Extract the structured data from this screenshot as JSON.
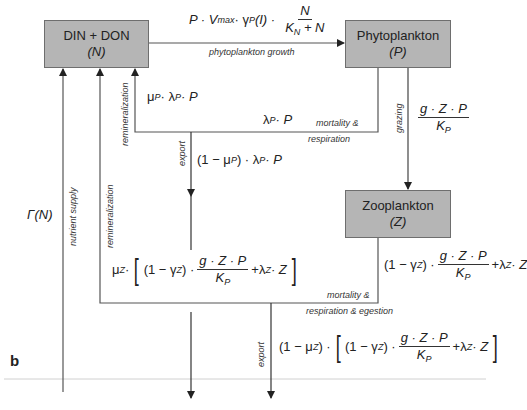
{
  "panel_label": "b",
  "boxes": {
    "nutrient": {
      "name": "DIN + DON",
      "symbol": "(N)"
    },
    "phyto": {
      "name": "Phytoplankton",
      "symbol": "(P)"
    },
    "zoo": {
      "name": "Zooplankton",
      "symbol": "(Z)"
    }
  },
  "flows": {
    "growth": {
      "label": "phytoplankton growth",
      "eq_prefix": "P · V",
      "eq_vmax_sub": "max",
      "eq_gamma": " · γ",
      "eq_gamma_sub": "P",
      "eq_arg": "(I) ·",
      "frac_num": "N",
      "frac_den_k": "K",
      "frac_den_sub": "N",
      "frac_den_rest": " + N"
    },
    "remin_p": {
      "label": "remineralization",
      "eq_mu": "μ",
      "eq_mu_sub": "P",
      "eq_mid": " · λ",
      "eq_lam_sub": "P",
      "eq_end": " · P"
    },
    "mort_p": {
      "label_line1": "mortality &",
      "label_line2": "respiration",
      "eq_lam": "λ",
      "eq_lam_sub": "P",
      "eq_end": " · P"
    },
    "export_p": {
      "label": "export",
      "eq_start": "(1 − μ",
      "eq_mu_sub": "P",
      "eq_mid": ") · λ",
      "eq_lam_sub": "P",
      "eq_end": " · P"
    },
    "grazing": {
      "label": "grazing",
      "frac_num": "g · Z · P",
      "frac_den_k": "K",
      "frac_den_sub": "P"
    },
    "nutrient_supply": {
      "label": "nutrient supply",
      "eq": "Γ(N)"
    },
    "remin_z": {
      "label": "remineralization",
      "eq_mu": "μ",
      "eq_mu_sub": "Z",
      "eq_dot": " ·",
      "eq_gamma_start": "(1 − γ",
      "eq_gamma_sub": "Z",
      "eq_gamma_end": ") ·",
      "frac_num": "g · Z · P",
      "frac_den_k": "K",
      "frac_den_sub": "P",
      "eq_lam": "+λ",
      "eq_lam_sub": "Z",
      "eq_end": " · Z"
    },
    "mort_z": {
      "label_line1": "mortality &",
      "label_line2": "respiration & egestion",
      "eq_gamma_start": "(1 − γ",
      "eq_gamma_sub": "Z",
      "eq_gamma_end": ") ·",
      "frac_num": "g · Z · P",
      "frac_den_k": "K",
      "frac_den_sub": "P",
      "eq_lam": "+λ",
      "eq_lam_sub": "Z",
      "eq_end": " · Z"
    },
    "export_z": {
      "label": "export",
      "eq_start": "(1 − μ",
      "eq_mu_sub": "Z",
      "eq_mid": ") ·",
      "eq_gamma_start": "(1 − γ",
      "eq_gamma_sub": "Z",
      "eq_gamma_end": ") ·",
      "frac_num": "g · Z · P",
      "frac_den_k": "K",
      "frac_den_sub": "P",
      "eq_lam": "+λ",
      "eq_lam_sub": "Z",
      "eq_end": " · Z"
    }
  },
  "colors": {
    "box_fill": "#b5b5b5",
    "box_border": "#6e6e6e",
    "line": "#444444",
    "baseline": "#d0d0d0"
  }
}
